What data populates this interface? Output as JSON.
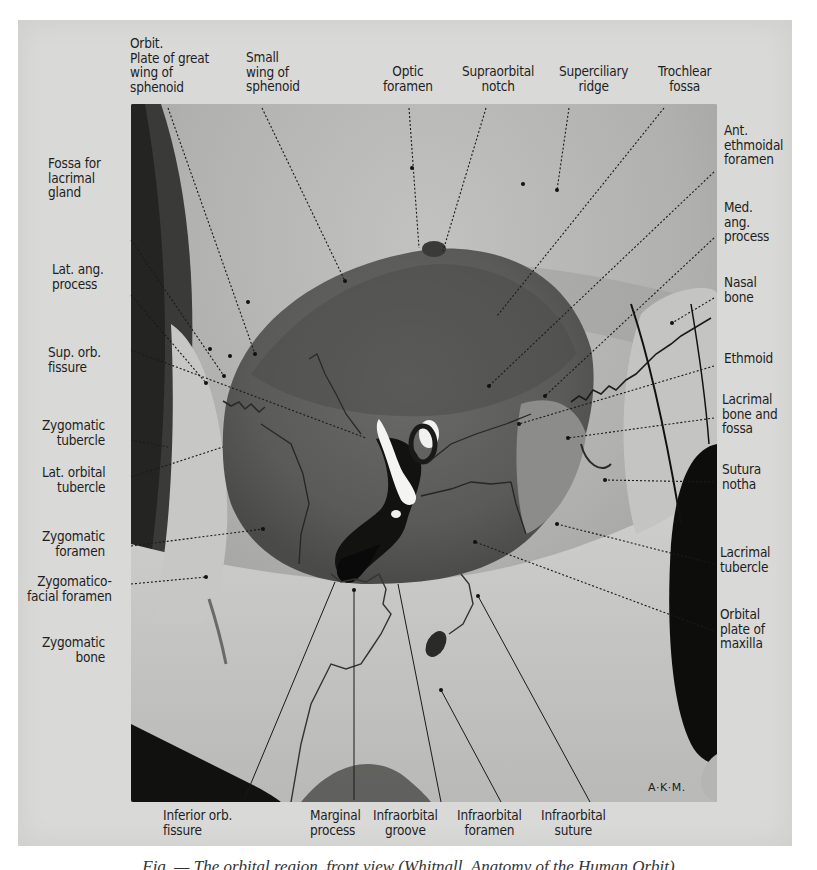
{
  "figure": {
    "artist_initials": "A·K·M.",
    "caption": "Fig. — The orbital region, front view (Whitnall, Anatomy of the Human Orbit)"
  },
  "labels": {
    "top": [
      {
        "id": "orbit-plate-great-wing",
        "text": "Orbit.\nPlate of great\nwing of\nsphenoid"
      },
      {
        "id": "small-wing-sphenoid",
        "text": "Small\nwing of\nsphenoid"
      },
      {
        "id": "optic-foramen",
        "text": "Optic\nforamen"
      },
      {
        "id": "supraorbital-notch",
        "text": "Supraorbital\nnotch"
      },
      {
        "id": "superciliary-ridge",
        "text": "Superciliary\nridge"
      },
      {
        "id": "trochlear-fossa",
        "text": "Trochlear\nfossa"
      }
    ],
    "left": [
      {
        "id": "fossa-lacrimal-gland",
        "text": "Fossa for\nlacrimal\ngland"
      },
      {
        "id": "lat-ang-process",
        "text": "Lat. ang.\nprocess"
      },
      {
        "id": "sup-orb-fissure",
        "text": "Sup. orb.\nfissure"
      },
      {
        "id": "zygomatic-tubercle",
        "text": "Zygomatic\ntubercle"
      },
      {
        "id": "lat-orbital-tubercle",
        "text": "Lat. orbital\ntubercle"
      },
      {
        "id": "zygomatic-foramen",
        "text": "Zygomatic\nforamen"
      },
      {
        "id": "zygomaticofacial-foramen",
        "text": "Zygomatico-\nfacial foramen"
      },
      {
        "id": "zygomatic-bone",
        "text": "Zygomatic\nbone"
      }
    ],
    "right": [
      {
        "id": "ant-ethmoidal-foramen",
        "text": "Ant.\nethmoidal\nforamen"
      },
      {
        "id": "med-ang-process",
        "text": "Med.\nang.\nprocess"
      },
      {
        "id": "nasal-bone",
        "text": "Nasal\nbone"
      },
      {
        "id": "ethmoid",
        "text": "Ethmoid"
      },
      {
        "id": "lacrimal-bone-fossa",
        "text": "Lacrimal\nbone and\nfossa"
      },
      {
        "id": "sutura-notha",
        "text": "Sutura\nnotha"
      },
      {
        "id": "lacrimal-tubercle",
        "text": "Lacrimal\ntubercle"
      },
      {
        "id": "orbital-plate-maxilla",
        "text": "Orbital\nplate of\nmaxilla"
      }
    ],
    "bottom": [
      {
        "id": "inferior-orb-fissure",
        "text": "Inferior orb.\nfissure"
      },
      {
        "id": "marginal-process",
        "text": "Marginal\nprocess"
      },
      {
        "id": "infraorbital-groove",
        "text": "Infraorbital\ngroove"
      },
      {
        "id": "infraorbital-foramen",
        "text": "Infraorbital\nforamen"
      },
      {
        "id": "infraorbital-suture",
        "text": "Infraorbital\nsuture"
      }
    ]
  },
  "colors": {
    "plate_background": "#d9d9d7",
    "bone_light": "#c9c9c7",
    "bone_mid": "#a9a9a7",
    "orbit_dark": "#5f5f5d",
    "shadow_black": "#0e0e0e",
    "label_text": "#1e1e1e"
  }
}
